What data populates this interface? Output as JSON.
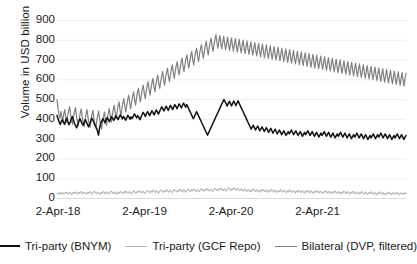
{
  "chart_data": {
    "type": "line",
    "title": "",
    "xlabel": "",
    "ylabel": "Volume in USD billion",
    "ylim": [
      0,
      900
    ],
    "yticks": [
      0,
      100,
      200,
      300,
      400,
      500,
      600,
      700,
      800,
      900
    ],
    "ytick_labels": [
      "0",
      "100",
      "200",
      "300",
      "400",
      "500",
      "600",
      "700",
      "800",
      "900"
    ],
    "xtick_labels": [
      "2-Apr-18",
      "2-Apr-19",
      "2-Apr-20",
      "2-Apr-21"
    ],
    "xtick_positions": [
      0,
      1,
      2,
      3
    ],
    "grid": true,
    "grid_axis": "y",
    "legend_position": "bottom",
    "series": [
      {
        "name": "Tri-party (BNYM)",
        "color": "#111111",
        "width": 1.5,
        "values": [
          417,
          399,
          383,
          372,
          388,
          396,
          381,
          372,
          392,
          404,
          386,
          371,
          382,
          398,
          412,
          394,
          378,
          366,
          355,
          372,
          388,
          401,
          390,
          376,
          368,
          382,
          396,
          384,
          371,
          360,
          374,
          391,
          403,
          392,
          379,
          368,
          356,
          341,
          318,
          352,
          376,
          389,
          401,
          392,
          380,
          395,
          407,
          398,
          386,
          399,
          412,
          403,
          392,
          404,
          416,
          407,
          396,
          409,
          420,
          411,
          400,
          412,
          404,
          393,
          406,
          418,
          409,
          398,
          410,
          402,
          414,
          425,
          416,
          405,
          417,
          408,
          396,
          409,
          421,
          433,
          424,
          412,
          425,
          437,
          428,
          416,
          429,
          441,
          432,
          420,
          433,
          445,
          436,
          424,
          437,
          449,
          461,
          452,
          440,
          452,
          464,
          455,
          443,
          456,
          468,
          459,
          447,
          460,
          472,
          463,
          451,
          464,
          476,
          467,
          455,
          468,
          480,
          471,
          459,
          472,
          460,
          448,
          437,
          425,
          413,
          401,
          412,
          424,
          436,
          425,
          413,
          401,
          389,
          377,
          365,
          353,
          341,
          330,
          318,
          330,
          342,
          354,
          366,
          378,
          390,
          402,
          414,
          426,
          438,
          450,
          462,
          474,
          486,
          498,
          489,
          477,
          465,
          477,
          489,
          478,
          466,
          478,
          490,
          479,
          467,
          479,
          491,
          480,
          468,
          456,
          444,
          432,
          420,
          408,
          396,
          384,
          372,
          360,
          348,
          358,
          368,
          356,
          344,
          354,
          364,
          352,
          340,
          350,
          360,
          348,
          336,
          346,
          356,
          344,
          332,
          342,
          352,
          340,
          328,
          338,
          348,
          336,
          324,
          334,
          344,
          332,
          320,
          330,
          340,
          328,
          316,
          326,
          336,
          324,
          334,
          344,
          332,
          320,
          330,
          340,
          328,
          316,
          326,
          336,
          324,
          312,
          322,
          332,
          320,
          330,
          340,
          328,
          316,
          326,
          336,
          324,
          312,
          322,
          332,
          320,
          308,
          318,
          328,
          316,
          326,
          336,
          324,
          312,
          322,
          332,
          320,
          308,
          318,
          328,
          316,
          304,
          314,
          324,
          312,
          322,
          332,
          320,
          308,
          318,
          328,
          316,
          304,
          314,
          324,
          312,
          300,
          310,
          320,
          308,
          318,
          328,
          316,
          304,
          314,
          324,
          312,
          300,
          310,
          320,
          308,
          296,
          306,
          316,
          304,
          314,
          324,
          312,
          300,
          310,
          320,
          308,
          318,
          328,
          316,
          304,
          314,
          324,
          312,
          300,
          310,
          320,
          308,
          296,
          306,
          316,
          304,
          314,
          324,
          312,
          300,
          310,
          320,
          308,
          296,
          306,
          316
        ]
      },
      {
        "name": "Tri-party (GCF Repo)",
        "color": "#b4b4b4",
        "width": 1.1,
        "values": [
          22,
          26,
          20,
          28,
          24,
          19,
          27,
          23,
          30,
          25,
          21,
          29,
          24,
          18,
          27,
          22,
          31,
          26,
          20,
          28,
          23,
          33,
          27,
          21,
          30,
          25,
          19,
          29,
          24,
          32,
          26,
          20,
          28,
          34,
          27,
          22,
          30,
          25,
          18,
          29,
          24,
          33,
          27,
          21,
          31,
          26,
          20,
          29,
          35,
          28,
          22,
          31,
          25,
          19,
          30,
          24,
          34,
          28,
          22,
          32,
          26,
          36,
          29,
          23,
          33,
          27,
          21,
          31,
          37,
          30,
          24,
          34,
          28,
          38,
          31,
          25,
          35,
          29,
          23,
          33,
          39,
          32,
          26,
          36,
          30,
          40,
          33,
          27,
          37,
          31,
          25,
          35,
          41,
          34,
          28,
          38,
          32,
          42,
          35,
          29,
          39,
          33,
          27,
          37,
          43,
          36,
          30,
          40,
          34,
          44,
          37,
          31,
          41,
          35,
          29,
          39,
          45,
          38,
          32,
          42,
          36,
          46,
          39,
          33,
          43,
          37,
          31,
          41,
          47,
          40,
          34,
          44,
          38,
          48,
          41,
          35,
          45,
          39,
          33,
          43,
          49,
          42,
          36,
          46,
          40,
          50,
          43,
          37,
          47,
          41,
          35,
          45,
          51,
          44,
          38,
          48,
          42,
          52,
          45,
          39,
          49,
          43,
          37,
          47,
          41,
          35,
          45,
          39,
          33,
          43,
          37,
          31,
          41,
          35,
          45,
          38,
          32,
          42,
          36,
          30,
          40,
          34,
          44,
          37,
          31,
          41,
          35,
          29,
          39,
          33,
          43,
          36,
          30,
          40,
          34,
          28,
          38,
          32,
          42,
          35,
          29,
          39,
          33,
          27,
          37,
          31,
          41,
          34,
          28,
          38,
          32,
          26,
          36,
          30,
          40,
          33,
          27,
          37,
          31,
          25,
          35,
          29,
          39,
          32,
          26,
          36,
          30,
          24,
          34,
          28,
          38,
          31,
          25,
          35,
          29,
          23,
          33,
          27,
          37,
          30,
          24,
          34,
          28,
          22,
          32,
          26,
          36,
          29,
          23,
          33,
          27,
          21,
          31,
          25,
          35,
          28,
          22,
          32,
          26,
          20,
          30,
          24,
          34,
          27,
          21,
          31,
          25,
          19,
          29,
          23,
          33,
          26,
          20,
          30,
          24,
          18,
          28,
          22,
          32,
          25,
          19,
          29,
          23,
          17,
          27,
          21,
          31,
          24,
          18,
          28,
          22,
          16,
          26,
          20,
          30,
          23,
          17,
          27,
          21,
          25,
          19,
          29,
          22,
          16,
          26,
          20,
          24,
          18,
          28,
          21
        ]
      },
      {
        "name": "Bilateral (DVP, filtered)",
        "color": "#808080",
        "width": 1.2,
        "values": [
          498,
          455,
          423,
          401,
          438,
          412,
          389,
          425,
          447,
          408,
          382,
          419,
          441,
          462,
          421,
          394,
          372,
          408,
          436,
          457,
          416,
          388,
          366,
          402,
          430,
          451,
          410,
          383,
          361,
          398,
          426,
          447,
          406,
          379,
          357,
          394,
          422,
          443,
          402,
          375,
          353,
          390,
          418,
          439,
          398,
          371,
          349,
          386,
          414,
          435,
          394,
          367,
          403,
          431,
          452,
          411,
          384,
          420,
          448,
          469,
          428,
          401,
          437,
          465,
          486,
          445,
          418,
          454,
          482,
          503,
          462,
          435,
          471,
          499,
          520,
          479,
          452,
          488,
          516,
          537,
          496,
          469,
          505,
          533,
          554,
          513,
          486,
          522,
          550,
          571,
          530,
          503,
          539,
          567,
          588,
          547,
          520,
          556,
          584,
          605,
          564,
          537,
          573,
          601,
          622,
          581,
          554,
          590,
          618,
          639,
          598,
          571,
          607,
          635,
          656,
          615,
          588,
          624,
          652,
          673,
          632,
          605,
          641,
          669,
          690,
          649,
          622,
          658,
          686,
          707,
          666,
          639,
          675,
          703,
          724,
          683,
          656,
          692,
          720,
          741,
          700,
          673,
          709,
          737,
          758,
          717,
          690,
          726,
          754,
          775,
          734,
          707,
          743,
          771,
          792,
          751,
          724,
          760,
          788,
          809,
          768,
          741,
          777,
          805,
          826,
          785,
          758,
          794,
          822,
          781,
          754,
          790,
          818,
          777,
          750,
          786,
          814,
          773,
          746,
          782,
          810,
          769,
          742,
          778,
          806,
          765,
          738,
          774,
          802,
          761,
          734,
          770,
          798,
          757,
          730,
          766,
          794,
          753,
          726,
          762,
          790,
          749,
          722,
          758,
          786,
          745,
          718,
          754,
          782,
          741,
          714,
          750,
          778,
          737,
          710,
          746,
          774,
          733,
          706,
          742,
          770,
          729,
          702,
          738,
          766,
          725,
          698,
          734,
          762,
          721,
          694,
          730,
          758,
          717,
          690,
          726,
          754,
          713,
          686,
          722,
          750,
          709,
          682,
          718,
          746,
          705,
          678,
          714,
          742,
          701,
          674,
          710,
          738,
          697,
          670,
          706,
          734,
          693,
          666,
          702,
          730,
          689,
          662,
          698,
          726,
          685,
          658,
          694,
          722,
          681,
          654,
          690,
          718,
          677,
          650,
          686,
          714,
          673,
          646,
          682,
          710,
          669,
          642,
          678,
          706,
          665,
          638,
          674,
          702,
          661,
          634,
          670,
          698,
          657,
          630,
          666,
          694,
          653,
          626,
          662,
          690,
          649,
          622,
          658,
          686,
          645,
          618,
          654,
          682,
          641,
          614,
          650,
          678,
          637,
          610,
          646,
          674,
          633,
          606,
          642,
          670,
          629,
          602,
          638,
          666,
          625,
          598,
          634,
          662,
          621,
          594,
          630,
          658,
          617,
          590,
          626,
          654,
          613,
          586,
          622,
          650,
          609,
          582,
          618,
          646,
          605,
          578,
          614,
          642,
          601,
          574,
          610,
          638,
          597,
          570,
          606,
          634,
          593,
          566,
          602,
          630
        ]
      }
    ]
  }
}
